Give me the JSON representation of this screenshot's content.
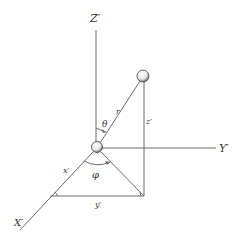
{
  "diagram": {
    "axes": {
      "z_label": "Z′",
      "y_label": "Y′",
      "x_label": "X′"
    },
    "quantities": {
      "r": "r",
      "theta": "θ",
      "phi": "φ",
      "x_component": "x′",
      "y_component": "y′",
      "z_component": "z′"
    },
    "objects": {
      "origin": "origin-sphere",
      "particle": "particle-sphere"
    },
    "colors": {
      "line": "#6a6a6a",
      "text": "#333333",
      "background": "#ffffff"
    }
  }
}
